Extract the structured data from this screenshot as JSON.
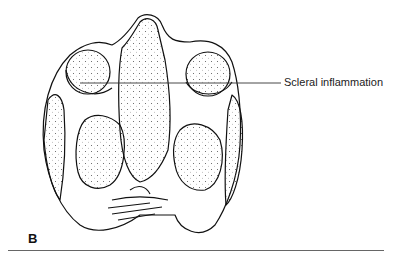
{
  "figure": {
    "panel_label": "B",
    "annotations": [
      {
        "text": "Scleral inflammation",
        "target": "right-orbit-sclera"
      }
    ]
  }
}
